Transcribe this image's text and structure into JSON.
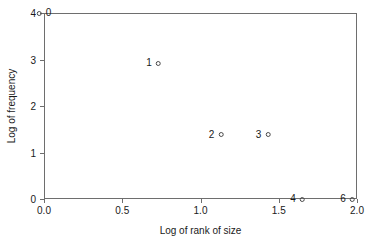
{
  "chart_data": {
    "type": "scatter",
    "title": "",
    "xlabel": "Log of rank of size",
    "ylabel": "Log of frequency",
    "xlim": [
      0.0,
      2.0
    ],
    "ylim": [
      0.0,
      4.0
    ],
    "grid": false,
    "legend": "none",
    "xticks": [
      "0.0",
      "0.5",
      "1.0",
      "1.5",
      "2.0"
    ],
    "xtick_values": [
      0.0,
      0.5,
      1.0,
      1.5,
      2.0
    ],
    "yticks": [
      "0",
      "1",
      "2",
      "3",
      "4"
    ],
    "ytick_values": [
      0,
      1,
      2,
      3,
      4
    ],
    "marker_style": "open-circle",
    "points": [
      {
        "label": "0",
        "x": 0.0,
        "y": 4.0,
        "label_side": "right"
      },
      {
        "label": "1",
        "x": 0.7,
        "y": 2.92,
        "label_side": "left"
      },
      {
        "label": "2",
        "x": 1.1,
        "y": 1.38,
        "label_side": "left"
      },
      {
        "label": "3",
        "x": 1.4,
        "y": 1.38,
        "label_side": "left"
      },
      {
        "label": "4",
        "x": 1.62,
        "y": 0.0,
        "label_side": "left"
      },
      {
        "label": "6",
        "x": 1.94,
        "y": 0.0,
        "label_side": "left"
      }
    ],
    "colors": {
      "background": "#ffffff",
      "axis": "#6e6e6e",
      "text": "#1a1a1a",
      "marker": "#4a4a4a"
    }
  }
}
